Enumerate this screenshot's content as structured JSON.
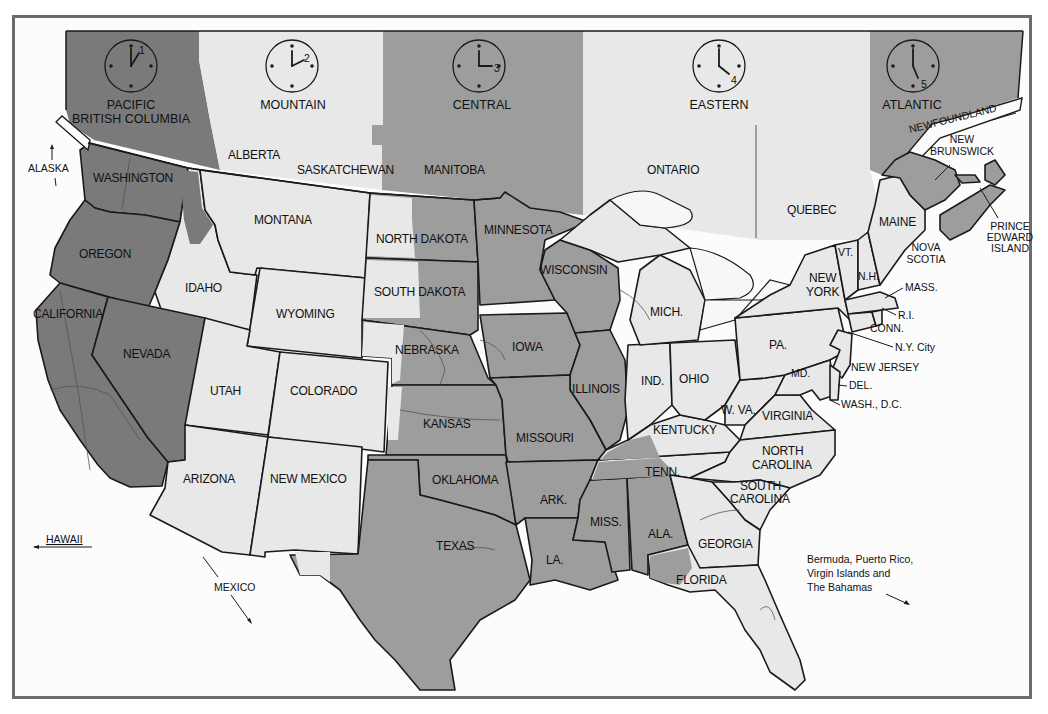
{
  "map": {
    "title": "North American Time Zones",
    "colors": {
      "pacific": "#7a7a7a",
      "mountain": "#e8e8e8",
      "central": "#9d9d9d",
      "eastern": "#e8e8e8",
      "atlantic": "#9d9d9d",
      "border": "#6b6b6b",
      "background": "#fcfcfc"
    },
    "zones": [
      {
        "name": "PACIFIC",
        "subname": "BRITISH COLUMBIA",
        "clock_hour": "1"
      },
      {
        "name": "MOUNTAIN",
        "clock_hour": "2"
      },
      {
        "name": "CENTRAL",
        "clock_hour": "3"
      },
      {
        "name": "EASTERN",
        "clock_hour": "4"
      },
      {
        "name": "ATLANTIC",
        "clock_hour": "5"
      }
    ],
    "canada_labels": {
      "alberta": "ALBERTA",
      "saskatchewan": "SASKATCHEWAN",
      "manitoba": "MANITOBA",
      "ontario": "ONTARIO",
      "quebec": "QUEBEC",
      "newfoundland": "NEWFOUNDLAND",
      "new_brunswick_1": "NEW",
      "new_brunswick_2": "BRUNSWICK",
      "nova_scotia_1": "NOVA",
      "nova_scotia_2": "SCOTIA",
      "pei_1": "PRINCE",
      "pei_2": "EDWARD",
      "pei_3": "ISLAND"
    },
    "states": {
      "washington": "WASHINGTON",
      "oregon": "OREGON",
      "california": "CALIFORNIA",
      "nevada": "NEVADA",
      "idaho": "IDAHO",
      "montana": "MONTANA",
      "wyoming": "WYOMING",
      "utah": "UTAH",
      "colorado": "COLORADO",
      "arizona": "ARIZONA",
      "new_mexico": "NEW MEXICO",
      "north_dakota": "NORTH DAKOTA",
      "south_dakota": "SOUTH DAKOTA",
      "nebraska": "NEBRASKA",
      "kansas": "KANSAS",
      "oklahoma": "OKLAHOMA",
      "texas": "TEXAS",
      "minnesota": "MINNESOTA",
      "iowa": "IOWA",
      "missouri": "MISSOURI",
      "arkansas": "ARK.",
      "louisiana": "LA.",
      "wisconsin": "WISCONSIN",
      "illinois": "ILLINOIS",
      "mississippi": "MISS.",
      "alabama": "ALA.",
      "tennessee": "TENN.",
      "kentucky": "KENTUCKY",
      "michigan": "MICH.",
      "indiana": "IND.",
      "ohio": "OHIO",
      "georgia": "GEORGIA",
      "florida": "FLORIDA",
      "south_carolina_1": "SOUTH",
      "south_carolina_2": "CAROLINA",
      "north_carolina_1": "NORTH",
      "north_carolina_2": "CAROLINA",
      "virginia": "VIRGINIA",
      "west_virginia": "W. VA.",
      "pennsylvania": "PA.",
      "new_york_1": "NEW",
      "new_york_2": "YORK",
      "vermont": "VT.",
      "new_hampshire": "N.H.",
      "maine": "MAINE",
      "massachusetts": "MASS.",
      "rhode_island": "R.I.",
      "connecticut": "CONN.",
      "ny_city": "N.Y. City",
      "new_jersey": "NEW JERSEY",
      "maryland": "MD.",
      "delaware": "DEL.",
      "washington_dc": "WASH., D.C."
    },
    "external": {
      "alaska": "ALASKA",
      "hawaii": "HAWAII",
      "mexico": "MEXICO",
      "caribbean_1": "Bermuda, Puerto Rico,",
      "caribbean_2": "Virgin Islands and",
      "caribbean_3": "The Bahamas"
    }
  }
}
